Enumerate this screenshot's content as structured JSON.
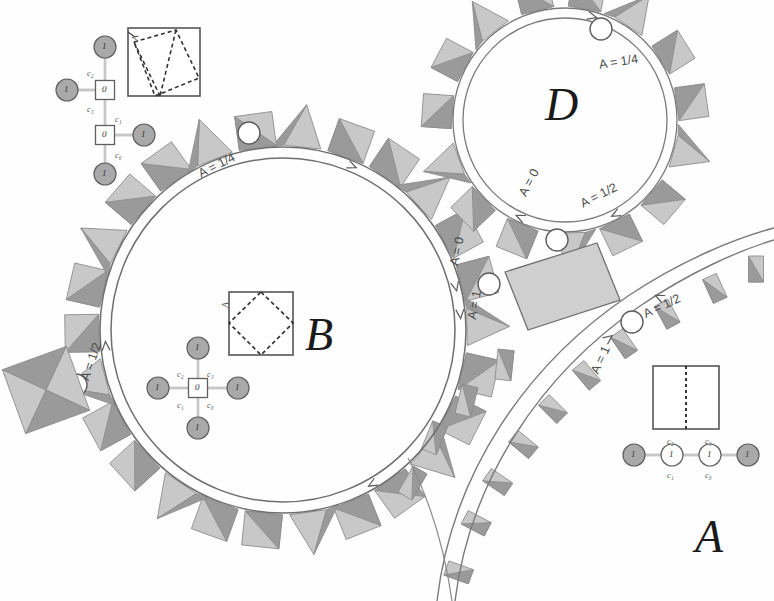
{
  "figure": {
    "background_color": "#fefefe",
    "ink_color": "#3a3a3a",
    "gray_dark": "#9a9a9a",
    "gray_light": "#c8c8c8"
  },
  "components": {
    "big_letters": [
      {
        "name": "letter-B",
        "text": "B",
        "x": 305,
        "y": 340
      },
      {
        "name": "letter-D",
        "text": "D",
        "x": 555,
        "y": 105
      },
      {
        "name": "letter-A",
        "text": "A",
        "x": 700,
        "y": 535
      }
    ]
  },
  "circle_B": {
    "name": "circle-B",
    "cx": 283,
    "cy": 330,
    "r_outer": 183,
    "r_inner": 173,
    "labels": [
      {
        "name": "arc-label-b-quarter",
        "text": "A = 1/4",
        "x": 196,
        "y": 168,
        "rot": -27
      },
      {
        "name": "arc-label-b-zero",
        "text": "A = 0",
        "x": 447,
        "y": 264,
        "rot": -78
      },
      {
        "name": "arc-label-b-one",
        "text": "A = 1",
        "x": 465,
        "y": 318,
        "rot": -80
      },
      {
        "name": "arc-label-b-half",
        "text": "A = 1/2",
        "x": 78,
        "y": 378,
        "rot": -71
      }
    ],
    "junction_circles": [
      {
        "name": "junction-node-b-top",
        "cx": 249,
        "cy": 133,
        "r": 11
      },
      {
        "name": "junction-node-b-left",
        "cx": 76,
        "cy": 385,
        "r": 11
      },
      {
        "name": "junction-node-b-right",
        "cx": 489,
        "cy": 284,
        "r": 11
      }
    ]
  },
  "circle_D": {
    "name": "circle-D",
    "cx": 565,
    "cy": 120,
    "r_outer": 112,
    "r_inner": 103,
    "labels": [
      {
        "name": "arc-label-d-quarter",
        "text": "A = 1/4",
        "x": 598,
        "y": 58,
        "rot": -9
      },
      {
        "name": "arc-label-d-zero",
        "text": "A = 0",
        "x": 516,
        "y": 192,
        "rot": -62
      },
      {
        "name": "arc-label-d-half",
        "text": "A = 1/2",
        "x": 578,
        "y": 198,
        "rot": -27
      }
    ],
    "junction_circles": [
      {
        "name": "junction-node-d-top",
        "cx": 601,
        "cy": 29,
        "r": 11
      },
      {
        "name": "junction-node-d-bottom",
        "cx": 557,
        "cy": 240,
        "r": 11
      }
    ]
  },
  "curve_A": {
    "name": "curve-A",
    "labels": [
      {
        "name": "arc-label-a-half",
        "text": "A = 1/2",
        "x": 641,
        "y": 308,
        "rot": -25
      },
      {
        "name": "arc-label-a-one",
        "text": "A = 1",
        "x": 588,
        "y": 370,
        "rot": -65
      }
    ],
    "junction_circles": [
      {
        "name": "junction-node-a-top",
        "cx": 632,
        "cy": 322,
        "r": 11
      }
    ]
  },
  "square_top_left": {
    "name": "square-diagram-top-left",
    "x": 128,
    "y": 28,
    "w": 72,
    "h": 68,
    "corner_label": {
      "name": "corner-label-A",
      "text": "A"
    },
    "dashed_shape": "tilted-quadrilateral-with-midline"
  },
  "square_B": {
    "name": "square-diagram-B",
    "x": 229,
    "y": 292,
    "w": 64,
    "h": 63,
    "corner_label": {
      "name": "corner-label-A",
      "text": "A"
    },
    "dashed_shape": "inscribed-diamond"
  },
  "square_A": {
    "name": "square-diagram-A",
    "x": 653,
    "y": 366,
    "w": 66,
    "h": 63,
    "dashed_shape": "vertical-midline"
  },
  "graph_top_left": {
    "name": "graph-top-left",
    "nodes": [
      {
        "name": "graph-node-top",
        "label": "1",
        "kind": "filled",
        "cx": 105,
        "cy": 47,
        "r": 11
      },
      {
        "name": "graph-node-square-upper",
        "label": "0",
        "kind": "square",
        "cx": 105,
        "cy": 90,
        "size": 19
      },
      {
        "name": "graph-node-left",
        "label": "1",
        "kind": "filled",
        "cx": 67,
        "cy": 90,
        "r": 11
      },
      {
        "name": "graph-node-square-lower",
        "label": "0",
        "kind": "square",
        "cx": 105,
        "cy": 135,
        "size": 19
      },
      {
        "name": "graph-node-right",
        "label": "1",
        "kind": "filled",
        "cx": 144,
        "cy": 135,
        "r": 11
      },
      {
        "name": "graph-node-bottom",
        "label": "1",
        "kind": "filled",
        "cx": 105,
        "cy": 174,
        "r": 11
      }
    ],
    "edge_labels": [
      {
        "name": "edge-label-c2",
        "text": "c₂",
        "x": 87,
        "y": 68
      },
      {
        "name": "edge-label-c3",
        "text": "c₃",
        "x": 87,
        "y": 104
      },
      {
        "name": "edge-label-c1",
        "text": "c₁",
        "x": 115,
        "y": 114
      },
      {
        "name": "edge-label-c0",
        "text": "c₀",
        "x": 115,
        "y": 150
      }
    ]
  },
  "graph_B": {
    "name": "graph-B",
    "nodes": [
      {
        "name": "graph-node-center",
        "label": "0",
        "kind": "square",
        "cx": 198,
        "cy": 388,
        "size": 19
      },
      {
        "name": "graph-node-up",
        "label": "1",
        "kind": "filled",
        "cx": 198,
        "cy": 348,
        "r": 11
      },
      {
        "name": "graph-node-down",
        "label": "1",
        "kind": "filled",
        "cx": 198,
        "cy": 428,
        "r": 11
      },
      {
        "name": "graph-node-left",
        "label": "1",
        "kind": "filled",
        "cx": 158,
        "cy": 388,
        "r": 11
      },
      {
        "name": "graph-node-right",
        "label": "1",
        "kind": "filled",
        "cx": 238,
        "cy": 388,
        "r": 11
      }
    ],
    "edge_labels": [
      {
        "name": "edge-label-c2",
        "text": "c₂",
        "x": 177,
        "y": 369
      },
      {
        "name": "edge-label-c3",
        "text": "c₃",
        "x": 207,
        "y": 369
      },
      {
        "name": "edge-label-c1",
        "text": "c₁",
        "x": 177,
        "y": 400
      },
      {
        "name": "edge-label-c0",
        "text": "c₀",
        "x": 207,
        "y": 400
      }
    ]
  },
  "graph_A": {
    "name": "graph-A",
    "nodes": [
      {
        "name": "graph-node-far-left",
        "label": "1",
        "kind": "filled",
        "cx": 634,
        "cy": 455,
        "r": 11
      },
      {
        "name": "graph-node-mid-left",
        "label": "1",
        "kind": "open",
        "cx": 672,
        "cy": 455,
        "r": 11
      },
      {
        "name": "graph-node-mid-right",
        "label": "1",
        "kind": "open",
        "cx": 710,
        "cy": 455,
        "r": 11
      },
      {
        "name": "graph-node-far-right",
        "label": "1",
        "kind": "filled",
        "cx": 748,
        "cy": 455,
        "r": 11
      }
    ],
    "edge_labels": [
      {
        "name": "edge-label-c2",
        "text": "c₂",
        "x": 667,
        "y": 436
      },
      {
        "name": "edge-label-c3",
        "text": "c₃",
        "x": 705,
        "y": 436
      },
      {
        "name": "edge-label-c1",
        "text": "c₁",
        "x": 667,
        "y": 470
      },
      {
        "name": "edge-label-c0",
        "text": "c₀",
        "x": 705,
        "y": 470
      }
    ]
  },
  "chart_data": {
    "type": "diagram",
    "annotations": [
      "A = 0",
      "A = 1/4",
      "A = 1/2",
      "A = 1"
    ],
    "node_labels": [
      "0",
      "1"
    ],
    "edge_labels": [
      "c₀",
      "c₁",
      "c₂",
      "c₃"
    ],
    "region_labels": [
      "A",
      "B",
      "D"
    ]
  }
}
